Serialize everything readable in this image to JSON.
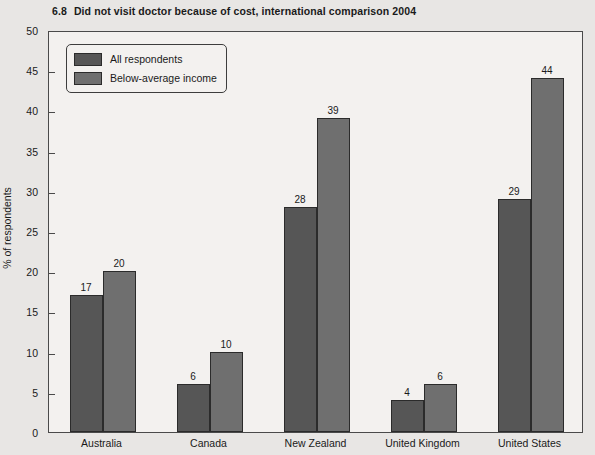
{
  "chart_data": {
    "type": "bar",
    "title_number": "6.8",
    "title_text": "Did not visit doctor because of cost, international comparison 2004",
    "xlabel": "",
    "ylabel": "% of respondents",
    "ylim": [
      0,
      50
    ],
    "ytick_step": 5,
    "yticks": [
      50,
      45,
      40,
      35,
      30,
      25,
      20,
      15,
      10,
      5,
      0
    ],
    "ytick_labels": [
      "50",
      "45",
      "40",
      "35",
      "30",
      "25",
      "20",
      "15",
      "10",
      "5",
      "0"
    ],
    "grid": false,
    "legend_position": "top-left",
    "categories": [
      "Australia",
      "Canada",
      "New Zealand",
      "United Kingdom",
      "United States"
    ],
    "series": [
      {
        "name": "All respondents",
        "color": "#565656",
        "values": [
          17,
          6,
          28,
          4,
          29
        ],
        "labels": [
          "17",
          "6",
          "28",
          "4",
          "29"
        ]
      },
      {
        "name": "Below-average income",
        "color": "#6f6f6f",
        "values": [
          20,
          10,
          39,
          6,
          44
        ],
        "labels": [
          "20",
          "10",
          "39",
          "6",
          "44"
        ]
      }
    ]
  },
  "colors": {
    "page_background": "#e8e6e4",
    "plot_background": "#f3f1ef",
    "axis": "#4a4a4a",
    "bar_outline": "#2b2b2b",
    "series_all_respondents": "#565656",
    "series_below_average_income": "#6f6f6f"
  }
}
